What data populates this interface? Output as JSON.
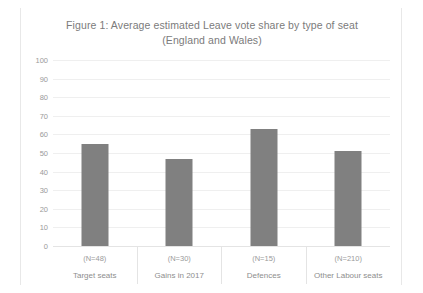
{
  "chart_data": {
    "type": "bar",
    "title": "Figure 1: Average estimated Leave vote share by type of seat (England and Wales)",
    "title_line1": "Figure 1: Average estimated Leave vote share by type of seat",
    "title_line2": "(England and Wales)",
    "xlabel": "",
    "ylabel": "",
    "ylim": [
      0,
      100
    ],
    "ytick_labels": [
      "100",
      "90",
      "80",
      "70",
      "60",
      "50",
      "40",
      "30",
      "20",
      "10",
      "0"
    ],
    "ytick_values": [
      100,
      90,
      80,
      70,
      60,
      50,
      40,
      30,
      20,
      10,
      0
    ],
    "grid": true,
    "legend": "none",
    "categories": [
      "Target seats",
      "Gains in 2017",
      "Defences",
      "Other Labour seats"
    ],
    "category_counts": [
      "(N=48)",
      "(N=30)",
      "(N=15)",
      "(N=210)"
    ],
    "values": [
      55,
      47,
      63,
      51
    ],
    "bar_color": "#808080",
    "gridline_color": "#efefef",
    "text_color": "#9a9a9a",
    "background": "#ffffff"
  },
  "bars": [
    {
      "label": "Target seats",
      "count": "(N=48)",
      "value": 55
    },
    {
      "label": "Gains in 2017",
      "count": "(N=30)",
      "value": 47
    },
    {
      "label": "Defences",
      "count": "(N=15)",
      "value": 63
    },
    {
      "label": "Other Labour seats",
      "count": "(N=210)",
      "value": 51
    }
  ]
}
